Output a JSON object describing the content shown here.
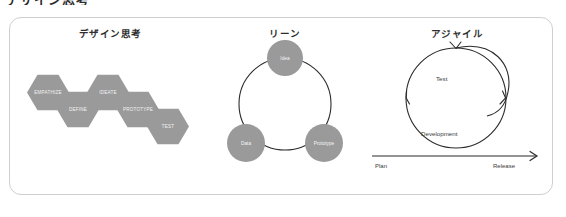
{
  "top_clipped_text": "デザイン思考",
  "colors": {
    "card_border": "#cfcfcf",
    "shape_fill": "#9a9a9a",
    "shape_text": "#f2f2f2",
    "stroke": "#2b2b2b",
    "title_text": "#2e2e2e",
    "background": "#ffffff"
  },
  "panels": {
    "design_thinking": {
      "title": "デザイン思考",
      "steps": [
        {
          "label": "EMPATHIZE"
        },
        {
          "label": "DEFINE"
        },
        {
          "label": "IDEATE"
        },
        {
          "label": "PROTOTYPE"
        },
        {
          "label": "TEST"
        }
      ]
    },
    "lean": {
      "title": "リーン",
      "nodes": [
        {
          "label": "Idea"
        },
        {
          "label": "Data"
        },
        {
          "label": "Prototype"
        }
      ]
    },
    "agile": {
      "title": "アジャイル",
      "cycle_labels": [
        {
          "label": "Test"
        },
        {
          "label": "Development"
        }
      ],
      "axis": {
        "start_label": "Plan",
        "end_label": "Release"
      }
    }
  }
}
